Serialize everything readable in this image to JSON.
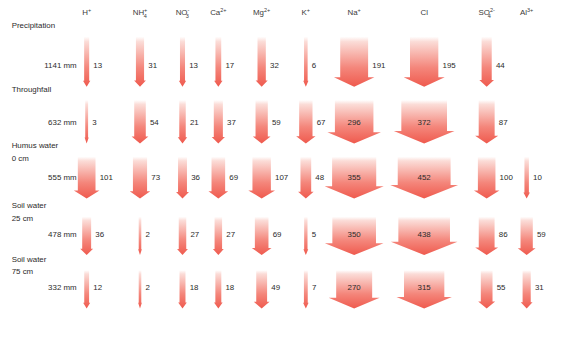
{
  "figure": {
    "unit_note": "mm",
    "accent_color": "#ef5a4e",
    "accent_color_pale": "#fbd9d4",
    "text_color": "#2b2b2b"
  },
  "columns": [
    {
      "id": "H",
      "name": "H+",
      "base": "H",
      "sub": "",
      "sup": "+",
      "x": 104,
      "label_x": 104
    },
    {
      "id": "NH4",
      "name": "NH4+",
      "base": "NH",
      "sub": "4",
      "sup": "+",
      "x": 168,
      "label_x": 168
    },
    {
      "id": "NO3",
      "name": "NO3-",
      "base": "NO",
      "sub": "3",
      "sup": "-",
      "x": 219,
      "label_x": 219
    },
    {
      "id": "Ca",
      "name": "Ca2+",
      "base": "Ca",
      "sub": "",
      "sup": "2+",
      "x": 262,
      "label_x": 262
    },
    {
      "id": "Mg",
      "name": "Mg2+",
      "base": "Mg",
      "sub": "",
      "sup": "2+",
      "x": 314,
      "label_x": 314
    },
    {
      "id": "K",
      "name": "K+",
      "base": "K",
      "sub": "",
      "sup": "+",
      "x": 367,
      "label_x": 367
    },
    {
      "id": "Na",
      "name": "Na+",
      "base": "Na",
      "sub": "",
      "sup": "+",
      "x": 425,
      "label_x": 425
    },
    {
      "id": "Cl",
      "name": "Cl",
      "base": "Cl",
      "sub": "",
      "sup": "",
      "x": 509,
      "label_x": 509
    },
    {
      "id": "SO4",
      "name": "SO42-",
      "base": "SO",
      "sub": "4",
      "sup": "2-",
      "x": 584,
      "label_x": 584
    },
    {
      "id": "Al",
      "name": "Al3+",
      "base": "Al",
      "sub": "",
      "sup": "3+",
      "x": 632,
      "label_x": 632
    }
  ],
  "layers": [
    {
      "id": "precipitation",
      "name": "Precipitation",
      "depth": "",
      "water": "1141 mm"
    },
    {
      "id": "throughfall",
      "name": "Throughfall",
      "depth": "",
      "water": "632 mm"
    },
    {
      "id": "humus-water",
      "name": "Humus water",
      "depth": "0 cm",
      "water": "555 mm"
    },
    {
      "id": "soil-water-25",
      "name": "Soil water",
      "depth": "25 cm",
      "water": "478 mm"
    },
    {
      "id": "soil-water-75",
      "name": "Soil water",
      "depth": "75 cm",
      "water": "332 mm"
    }
  ],
  "chart_data": {
    "type": "flow-diagram",
    "unit": "mol ha-1 a-1",
    "categories": [
      "H+",
      "NH4+",
      "NO3-",
      "Ca2+",
      "Mg2+",
      "K+",
      "Na+",
      "Cl",
      "SO42-",
      "Al3+"
    ],
    "layers": [
      "Precipitation",
      "Throughfall",
      "Humus water 0 cm",
      "Soil water 25 cm",
      "Soil water 75 cm"
    ],
    "water_flux": [
      "1141 mm",
      "632 mm",
      "555 mm",
      "478 mm",
      "332 mm"
    ],
    "series": [
      {
        "name": "Precipitation",
        "values": [
          13,
          31,
          13,
          17,
          32,
          6,
          191,
          195,
          44,
          null
        ]
      },
      {
        "name": "Throughfall",
        "values": [
          3,
          54,
          21,
          37,
          59,
          67,
          296,
          372,
          87,
          null
        ]
      },
      {
        "name": "Humus water 0 cm",
        "values": [
          101,
          73,
          36,
          69,
          107,
          48,
          355,
          452,
          100,
          10
        ]
      },
      {
        "name": "Soil water 25 cm",
        "values": [
          36,
          2,
          27,
          27,
          69,
          5,
          350,
          438,
          86,
          59
        ]
      },
      {
        "name": "Soil water 75 cm",
        "values": [
          12,
          2,
          18,
          18,
          49,
          7,
          270,
          315,
          55,
          31
        ]
      }
    ]
  }
}
